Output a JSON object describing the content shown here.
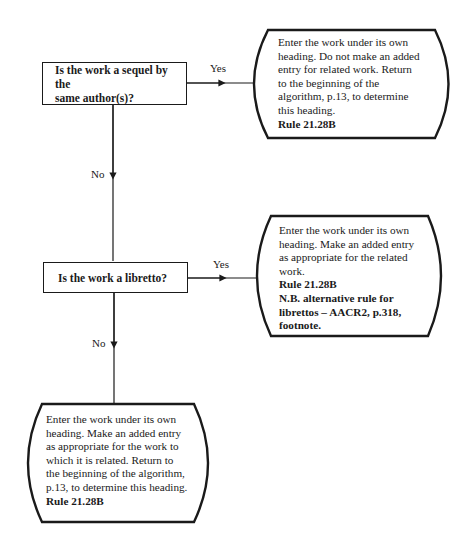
{
  "diagram": {
    "type": "flowchart",
    "decisions": [
      {
        "id": "q1",
        "text_lines": [
          "Is the work a sequel by the",
          "same author(s)?"
        ],
        "yes_label": "Yes",
        "no_label": "No"
      },
      {
        "id": "q2",
        "text_lines": [
          "Is the work a libretto?"
        ],
        "yes_label": "Yes",
        "no_label": "No"
      }
    ],
    "outcomes": [
      {
        "id": "t1",
        "from": "q1 Yes",
        "lines": [
          "Enter the work under its own",
          "heading. Do not make an added",
          "entry for related work. Return",
          "to the beginning of the",
          "algorithm, p.13, to determine",
          "this heading."
        ],
        "bold_lines": [
          "Rule 21.28B"
        ]
      },
      {
        "id": "t2",
        "from": "q2 Yes",
        "lines": [
          "Enter the work under its own",
          "heading. Make an added entry",
          "as appropriate for the related",
          "work."
        ],
        "bold_lines": [
          "Rule 21.28B",
          "N.B. alternative rule for",
          "librettos – AACR2, p.318,",
          "footnote."
        ]
      },
      {
        "id": "t3",
        "from": "q2 No",
        "lines": [
          "Enter the work under its own",
          "heading. Make an added entry",
          "as appropriate for the work to",
          "which it is related. Return to",
          "the beginning of the algorithm,",
          "p.13, to determine this heading."
        ],
        "bold_lines": [
          "Rule 21.28B"
        ]
      }
    ]
  }
}
